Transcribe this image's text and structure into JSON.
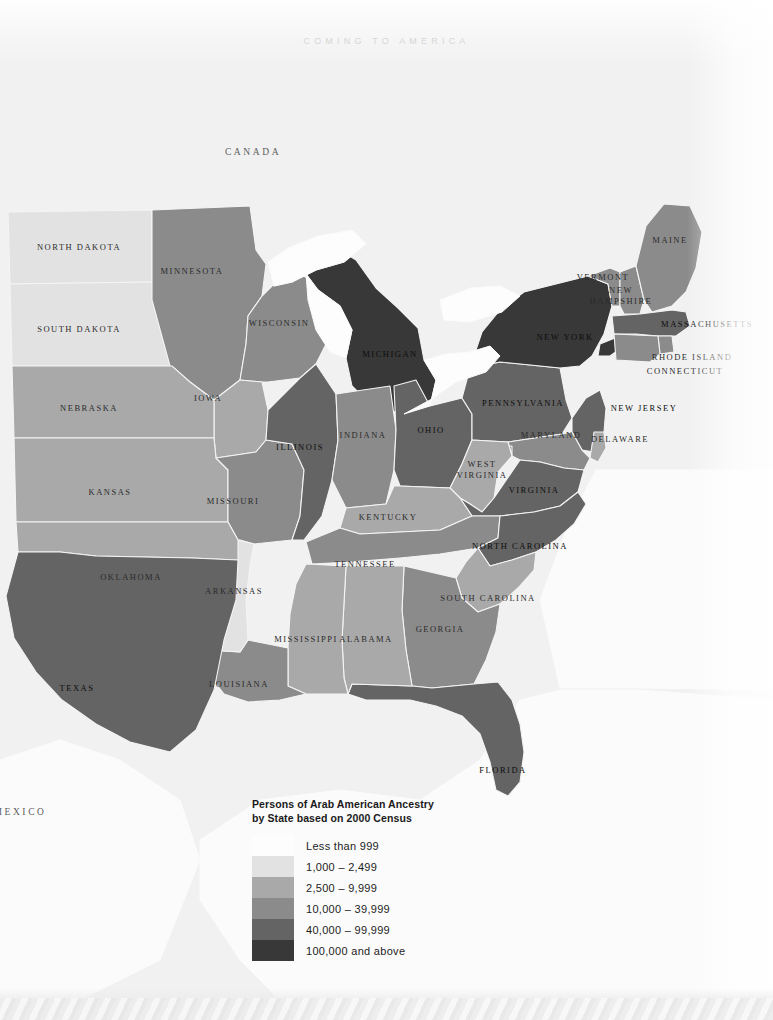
{
  "page": {
    "running_head": "COMING TO AMERICA"
  },
  "legend": {
    "title_line1": "Persons of Arab American Ancestry",
    "title_line2": "by State based on 2000 Census",
    "bins": [
      {
        "label": "Less than 999",
        "color": "#fdfdfd"
      },
      {
        "label": "1,000 – 2,499",
        "color": "#e2e2e2"
      },
      {
        "label": "2,500 – 9,999",
        "color": "#a9a9a9"
      },
      {
        "label": "10,000 – 39,999",
        "color": "#8b8b8b"
      },
      {
        "label": "40,000 – 99,999",
        "color": "#646464"
      },
      {
        "label": "100,000 and above",
        "color": "#383838"
      }
    ]
  },
  "map": {
    "background": "#f1f1f1",
    "water_color": "#fbfbfb",
    "border_color": "#f4f4f4",
    "countries": [
      {
        "name": "CANADA",
        "x": 253,
        "y": 152
      },
      {
        "name": "MEXICO",
        "x": 20,
        "y": 812
      }
    ],
    "states": [
      {
        "name": "NORTH DAKOTA",
        "bin": 1,
        "x": 79,
        "y": 247
      },
      {
        "name": "SOUTH DAKOTA",
        "bin": 1,
        "x": 79,
        "y": 329
      },
      {
        "name": "MINNESOTA",
        "bin": 3,
        "x": 192,
        "y": 271
      },
      {
        "name": "WISCONSIN",
        "bin": 3,
        "x": 279,
        "y": 323
      },
      {
        "name": "MICHIGAN",
        "bin": 5,
        "x": 390,
        "y": 354
      },
      {
        "name": "IOWA",
        "bin": 2,
        "x": 208,
        "y": 398
      },
      {
        "name": "NEBRASKA",
        "bin": 2,
        "x": 89,
        "y": 408
      },
      {
        "name": "KANSAS",
        "bin": 2,
        "x": 110,
        "y": 492
      },
      {
        "name": "MISSOURI",
        "bin": 3,
        "x": 233,
        "y": 501
      },
      {
        "name": "ILLINOIS",
        "bin": 4,
        "x": 300,
        "y": 447
      },
      {
        "name": "INDIANA",
        "bin": 3,
        "x": 363,
        "y": 435
      },
      {
        "name": "OHIO",
        "bin": 4,
        "x": 431,
        "y": 430
      },
      {
        "name": "PENNSYLVANIA",
        "bin": 4,
        "x": 523,
        "y": 403
      },
      {
        "name": "NEW YORK",
        "bin": 5,
        "x": 565,
        "y": 337
      },
      {
        "name": "VERMONT",
        "bin": 3,
        "x": 603,
        "y": 277
      },
      {
        "name": "NEW",
        "label2": "HAMPSHIRE",
        "bin": 3,
        "x": 621,
        "y": 296
      },
      {
        "name": "MAINE",
        "bin": 3,
        "x": 670,
        "y": 240
      },
      {
        "name": "MASSACHUSETTS",
        "bin": 4,
        "x": 707,
        "y": 324
      },
      {
        "name": "RHODE ISLAND",
        "bin": 3,
        "x": 692,
        "y": 357
      },
      {
        "name": "CONNECTICUT",
        "bin": 3,
        "x": 685,
        "y": 371
      },
      {
        "name": "NEW JERSEY",
        "bin": 4,
        "x": 644,
        "y": 408
      },
      {
        "name": "DELAWARE",
        "bin": 2,
        "x": 620,
        "y": 439
      },
      {
        "name": "MARYLAND",
        "bin": 3,
        "x": 551,
        "y": 435
      },
      {
        "name": "WEST",
        "label2": "VIRGINIA",
        "bin": 2,
        "x": 482,
        "y": 470
      },
      {
        "name": "VIRGINIA",
        "bin": 4,
        "x": 534,
        "y": 490
      },
      {
        "name": "KENTUCKY",
        "bin": 2,
        "x": 388,
        "y": 517
      },
      {
        "name": "TENNESSEE",
        "bin": 3,
        "x": 365,
        "y": 564
      },
      {
        "name": "NORTH CAROLINA",
        "bin": 4,
        "x": 520,
        "y": 546
      },
      {
        "name": "SOUTH CAROLINA",
        "bin": 2,
        "x": 488,
        "y": 598
      },
      {
        "name": "GEORGIA",
        "bin": 3,
        "x": 440,
        "y": 629
      },
      {
        "name": "FLORIDA",
        "bin": 4,
        "x": 503,
        "y": 770
      },
      {
        "name": "ALABAMA",
        "bin": 2,
        "x": 366,
        "y": 639
      },
      {
        "name": "MISSISSIPPI",
        "bin": 2,
        "x": 306,
        "y": 639
      },
      {
        "name": "LOUISIANA",
        "bin": 3,
        "x": 239,
        "y": 684
      },
      {
        "name": "ARKANSAS",
        "bin": 1,
        "x": 234,
        "y": 591
      },
      {
        "name": "OKLAHOMA",
        "bin": 2,
        "x": 131,
        "y": 577
      },
      {
        "name": "TEXAS",
        "bin": 4,
        "x": 77,
        "y": 688
      }
    ]
  }
}
